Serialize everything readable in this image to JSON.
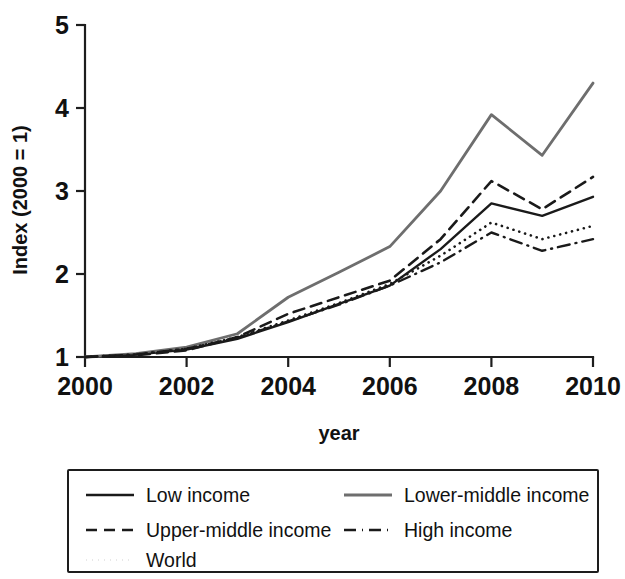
{
  "chart_data": {
    "type": "line",
    "title": "",
    "subtitle": "",
    "xlabel": "year",
    "ylabel": "Index (2000 = 1)",
    "x": [
      2000,
      2001,
      2002,
      2003,
      2004,
      2005,
      2006,
      2007,
      2008,
      2009,
      2010
    ],
    "xlim": [
      2000,
      2010
    ],
    "ylim": [
      1,
      5
    ],
    "xticks": [
      2000,
      2002,
      2004,
      2006,
      2008,
      2010
    ],
    "xtick_labels": [
      "2000",
      "2002",
      "2004",
      "2006",
      "2008",
      "2010"
    ],
    "yticks": [
      1,
      2,
      3,
      4,
      5
    ],
    "ytick_labels": [
      "1",
      "2",
      "3",
      "4",
      "5"
    ],
    "grid": false,
    "legend_position": "below-plot",
    "series": [
      {
        "name": "Low income",
        "style": "solid",
        "color": "#1a1a1a",
        "width": 2.4,
        "values": [
          1.0,
          1.03,
          1.09,
          1.22,
          1.42,
          1.64,
          1.86,
          2.3,
          2.85,
          2.7,
          2.93
        ]
      },
      {
        "name": "Lower-middle income",
        "style": "solid",
        "color": "#6e6e6e",
        "width": 2.8,
        "values": [
          1.0,
          1.04,
          1.12,
          1.28,
          1.72,
          2.02,
          2.33,
          3.0,
          3.92,
          3.43,
          4.3
        ]
      },
      {
        "name": "Upper-middle income",
        "style": "dashed",
        "color": "#1a1a1a",
        "width": 2.6,
        "values": [
          1.0,
          1.02,
          1.08,
          1.24,
          1.52,
          1.72,
          1.92,
          2.42,
          3.12,
          2.78,
          3.17
        ]
      },
      {
        "name": "High income",
        "style": "dashdot",
        "color": "#1a1a1a",
        "width": 2.4,
        "values": [
          1.0,
          1.03,
          1.1,
          1.23,
          1.43,
          1.63,
          1.86,
          2.14,
          2.5,
          2.28,
          2.42
        ]
      },
      {
        "name": "World",
        "style": "dotted",
        "color": "#1a1a1a",
        "width": 2.6,
        "values": [
          1.0,
          1.03,
          1.1,
          1.24,
          1.44,
          1.65,
          1.88,
          2.22,
          2.62,
          2.42,
          2.58
        ]
      }
    ],
    "legend_order": [
      "Low income",
      "Lower-middle income",
      "Upper-middle income",
      "High income",
      "World"
    ],
    "colors": {
      "axis": "#1d1d1d",
      "text": "#111111",
      "background": "#ffffff",
      "low_income": "#1a1a1a",
      "lower_middle_income": "#6e6e6e",
      "upper_middle_income": "#1a1a1a",
      "high_income": "#1a1a1a",
      "world": "#1a1a1a"
    }
  },
  "axis": {
    "y_title": "Index (2000 = 1)",
    "x_title": "year"
  },
  "legend": {
    "items": [
      {
        "label": "Low income",
        "style": "solid",
        "color": "#1a1a1a"
      },
      {
        "label": "Lower-middle income",
        "style": "solid",
        "color": "#6e6e6e"
      },
      {
        "label": "Upper-middle income",
        "style": "dashed",
        "color": "#1a1a1a"
      },
      {
        "label": "High income",
        "style": "dashdot",
        "color": "#1a1a1a"
      },
      {
        "label": "World",
        "style": "dotted",
        "color": "#1a1a1a"
      }
    ]
  }
}
